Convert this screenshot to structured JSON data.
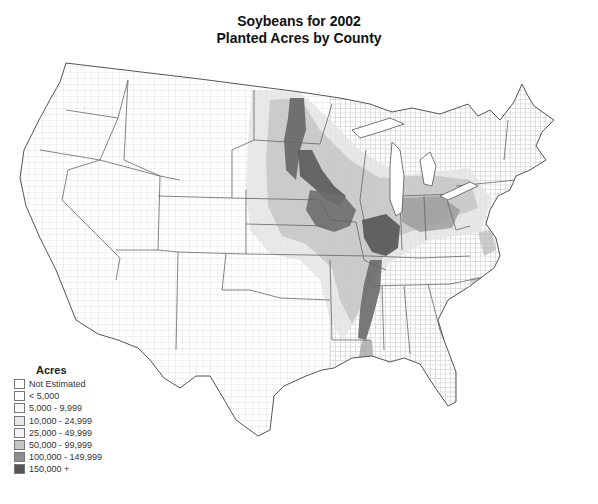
{
  "title": {
    "line1": "Soybeans for 2002",
    "line2": "Planted Acres by County"
  },
  "legend": {
    "title": "Acres",
    "items": [
      {
        "label": "Not Estimated",
        "color": "#ffffff"
      },
      {
        "label": "< 5,000",
        "color": "#ffffff"
      },
      {
        "label": "5,000 - 9,999",
        "color": "#f7f7f7"
      },
      {
        "label": "10,000 - 24,999",
        "color": "#e8e8e8"
      },
      {
        "label": "25,000 - 49,999",
        "color": "#f2f2f2"
      },
      {
        "label": "50,000 - 99,999",
        "color": "#c4c4c4"
      },
      {
        "label": "100,000 - 149,999",
        "color": "#8e8e8e"
      },
      {
        "label": "150,000 +",
        "color": "#555555"
      }
    ]
  },
  "map": {
    "region": "Contiguous United States",
    "unit": "County",
    "boundary_color": "#555555",
    "county_line_color": "#bbbbbb"
  }
}
